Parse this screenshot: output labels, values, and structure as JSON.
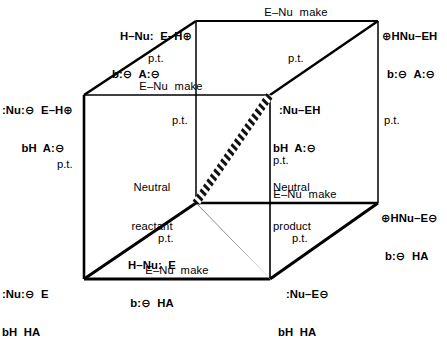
{
  "diagram": {
    "kind": "reaction-coordinate-cube",
    "line_color": "#000000",
    "background_color": "#ffffff"
  },
  "vertices": {
    "top_back_left": {
      "line1": "H–Nu:  E–H⊕",
      "line2": "b:⊖  A:⊖"
    },
    "top_back_right": {
      "line1": "⊕HNu–EH",
      "line2": "b:⊖  A:⊖"
    },
    "top_front_left": {
      "line1": ":Nu:⊖  E–H⊕",
      "line2": "bH  A:⊖"
    },
    "top_front_right": {
      "line1": ":Nu–EH",
      "line2": "bH  A:⊖",
      "line3": "Neutral",
      "line4": "product"
    },
    "bottom_back_left": {
      "line1": "Neutral",
      "line2": "reactant",
      "line3": "H–Nu:  E",
      "line4": "b:⊖  HA"
    },
    "bottom_back_right": {
      "line1": "⊕HNu–E⊖",
      "line2": "b:⊖  HA"
    },
    "bottom_front_left": {
      "line1": ":Nu:⊖  E",
      "line2": "bH  HA"
    },
    "bottom_front_right": {
      "line1": ":Nu–E⊖",
      "line2": "bH  HA"
    }
  },
  "edge_labels": {
    "e_nu_make": "E–Nu  make",
    "proton_transfer": "p.t."
  },
  "edges": [
    {
      "id": "top-back",
      "label": "E–Nu  make"
    },
    {
      "id": "top-front",
      "label": "E–Nu  make"
    },
    {
      "id": "bottom-back",
      "label": "E–Nu  make"
    },
    {
      "id": "bottom-front",
      "label": "E–Nu  make"
    },
    {
      "id": "depth-top-left",
      "label": "p.t."
    },
    {
      "id": "depth-top-right",
      "label": "p.t."
    },
    {
      "id": "depth-bottom-left",
      "label": "p.t."
    },
    {
      "id": "depth-bottom-right",
      "label": "p.t."
    },
    {
      "id": "vertical-left",
      "label": "p.t."
    },
    {
      "id": "vertical-mid",
      "label": "p.t."
    },
    {
      "id": "vertical-right-inner",
      "label": "p.t."
    },
    {
      "id": "vertical-right",
      "label": "p.t."
    }
  ],
  "reaction_path": {
    "style": "hatched-diagonal",
    "from": "bottom_back_left",
    "through": "top_front_right",
    "to": "bottom_front_right"
  }
}
